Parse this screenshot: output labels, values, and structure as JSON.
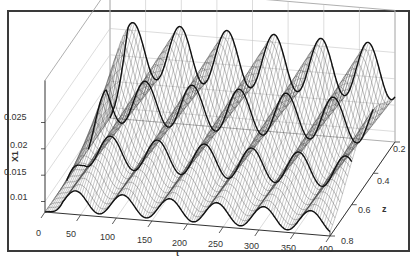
{
  "chart_data": {
    "type": "surface3d",
    "title": "",
    "xlabel": "t",
    "ylabel": "z",
    "zlabel": "X1",
    "x_ticks": [
      "0",
      "50",
      "100",
      "150",
      "200",
      "250",
      "300",
      "350",
      "400"
    ],
    "y_ticks": [
      "0.2",
      "0.4",
      "0.6",
      "0.8"
    ],
    "z_ticks": [
      "0.01",
      "0.015",
      "0.02",
      "0.025"
    ],
    "xlim": [
      0,
      400
    ],
    "ylim": [
      0.2,
      0.8
    ],
    "zlim": [
      0.008,
      0.027
    ],
    "grid": true,
    "legend": null,
    "surface": {
      "description": "Traveling-wave surface X1(t,z): periodic oscillation in t with ~6 peaks over 0-400, amplitude increasing from z=0.8 (front) to z=0.2 (back); initial ramp near t=0",
      "periods_over_range": 6,
      "period_t": 66,
      "back_edge_z": 0.2,
      "back_edge_min": 0.016,
      "back_edge_max": 0.0265,
      "front_edge_z": 0.8,
      "front_edge_min": 0.0085,
      "front_edge_max": 0.0125,
      "highlighted_z_slices": [
        0.2,
        0.4,
        0.6,
        0.8
      ],
      "mesh_color": "#444444",
      "highlight_color": "#111111"
    }
  }
}
